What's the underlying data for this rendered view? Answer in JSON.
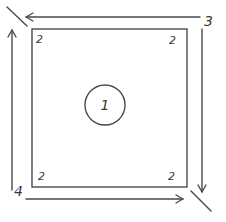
{
  "diagram": {
    "type": "layout-sketch",
    "stroke_color": "#4a4a4a",
    "background": "#ffffff",
    "center": {
      "label": "1",
      "shape": "circle"
    },
    "corners": {
      "top_left": "2",
      "top_right": "2",
      "bottom_left": "2",
      "bottom_right": "2"
    },
    "arrows": [
      {
        "id": "top",
        "direction": "left",
        "label": "3"
      },
      {
        "id": "right",
        "direction": "down"
      },
      {
        "id": "bottom",
        "direction": "right",
        "label": "4"
      },
      {
        "id": "left",
        "direction": "up"
      }
    ],
    "labels": {
      "top_right_arrow": "3",
      "bottom_left_arrow": "4"
    }
  }
}
